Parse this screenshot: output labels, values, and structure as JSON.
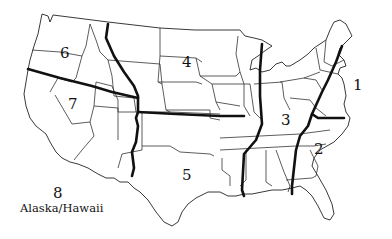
{
  "map": {
    "title": "US regions map",
    "regions": [
      {
        "id": "1",
        "label": "1"
      },
      {
        "id": "2",
        "label": "2"
      },
      {
        "id": "3",
        "label": "3"
      },
      {
        "id": "4",
        "label": "4"
      },
      {
        "id": "5",
        "label": "5"
      },
      {
        "id": "6",
        "label": "6"
      },
      {
        "id": "7",
        "label": "7"
      },
      {
        "id": "8",
        "label": "8",
        "sublabel": "Alaska/Hawaii"
      }
    ],
    "colors": {
      "background": "#ffffff",
      "lines": "#111111"
    }
  }
}
